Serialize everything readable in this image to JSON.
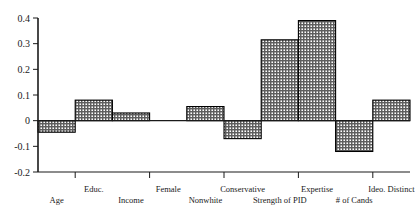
{
  "chart_data": {
    "type": "bar",
    "title": "",
    "subtitle": "",
    "xlabel": "",
    "ylabel": "",
    "ylim": [
      -0.2,
      0.4
    ],
    "grid": false,
    "legend": "none",
    "y_ticks": [
      "0.4",
      "0.3",
      "0.2",
      "0.1",
      "0",
      "-0.1",
      "-0.2"
    ],
    "y_tick_values": [
      0.4,
      0.3,
      0.2,
      0.1,
      0,
      -0.1,
      -0.2
    ],
    "categories": [
      "Age",
      "Educ.",
      "Income",
      "Female",
      "Nonwhite",
      "Conservative",
      "Strength of PID",
      "Expertise",
      "# of Cands",
      "Ideo. Distinct"
    ],
    "values": [
      -0.045,
      0.08,
      0.03,
      0.0,
      0.055,
      -0.07,
      0.315,
      0.39,
      -0.12,
      0.08
    ],
    "bar_fill": "#9a9a9a",
    "bar_edge": "#000000",
    "axis_color": "#1a1a1a"
  },
  "axis": {
    "y_axis_name": "value-axis",
    "x_axis_name": "category-axis"
  }
}
